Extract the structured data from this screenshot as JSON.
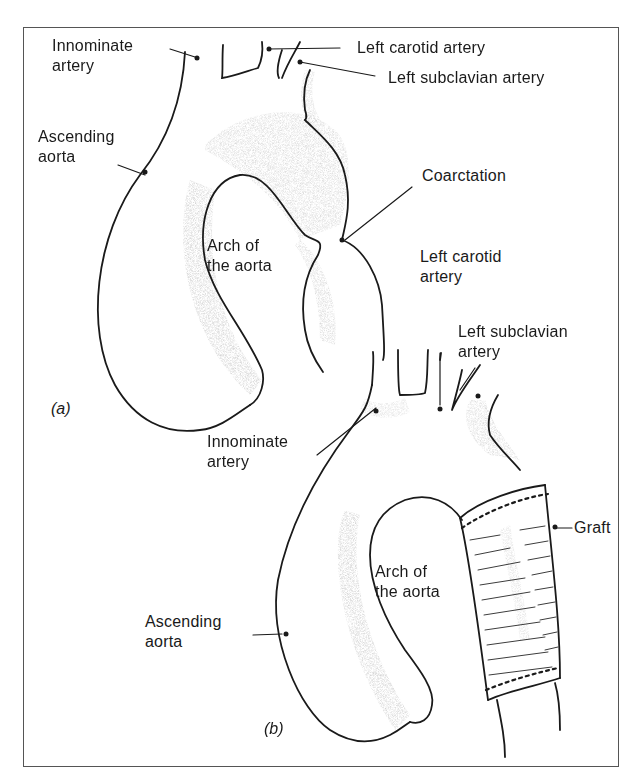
{
  "figure": {
    "panels": [
      {
        "id": "a",
        "label": "(a)",
        "labels": {
          "innominate_artery": [
            "Innominate",
            "artery"
          ],
          "left_carotid_artery": "Left carotid artery",
          "left_subclavian_artery": "Left subclavian artery",
          "ascending_aorta": [
            "Ascending",
            "aorta"
          ],
          "coarctation": "Coarctation",
          "arch_of_the_aorta": [
            "Arch of",
            "the aorta"
          ]
        }
      },
      {
        "id": "b",
        "label": "(b)",
        "labels": {
          "left_carotid_artery": [
            "Left carotid",
            "artery"
          ],
          "left_subclavian_artery": [
            "Left subclavian",
            "artery"
          ],
          "innominate_artery": [
            "Innominate",
            "artery"
          ],
          "graft": "Graft",
          "arch_of_the_aorta": [
            "Arch of",
            "the aorta"
          ],
          "ascending_aorta": [
            "Ascending",
            "aorta"
          ]
        }
      }
    ],
    "colors": {
      "ink": "#1a1a1a",
      "frame": "#555555",
      "stipple": "#9a9a9a"
    }
  }
}
